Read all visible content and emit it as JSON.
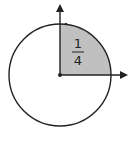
{
  "diagram": {
    "fraction": {
      "numerator": "1",
      "denominator": "4"
    },
    "shape": "circle",
    "shaded_region": "top-right quadrant",
    "colors": {
      "background": "#ffffff",
      "stroke": "#222222",
      "shade": "#c0c0c0"
    }
  }
}
